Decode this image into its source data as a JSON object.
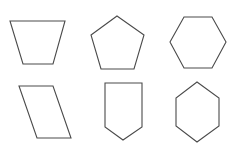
{
  "canvas": {
    "width": 238,
    "height": 148,
    "background": "#ffffff"
  },
  "style": {
    "stroke": "#4a4a4a",
    "stroke_width": 1.1
  },
  "shapes": [
    {
      "id": "trapezoid",
      "label": "trapezoid",
      "points": "10,21 65,21 53,64 23,64"
    },
    {
      "id": "pentagon",
      "label": "regular pentagon",
      "points": "117,16 144,35 134,69 101,69 91,35"
    },
    {
      "id": "hexagon-flat",
      "label": "hexagon (flat top)",
      "points": "184,17 212,17 226,42 212,68 184,68 170,42"
    },
    {
      "id": "parallelogram",
      "label": "parallelogram",
      "points": "19,86 53,86 71,138 37,138"
    },
    {
      "id": "shield-pentagon",
      "label": "pentagon (shield)",
      "points": "105,83 142,83 142,127 123,140 105,127"
    },
    {
      "id": "hexagon-pointy",
      "label": "hexagon (pointy top)",
      "points": "197,82 219,98 219,126 197,142 176,126 176,98"
    }
  ]
}
